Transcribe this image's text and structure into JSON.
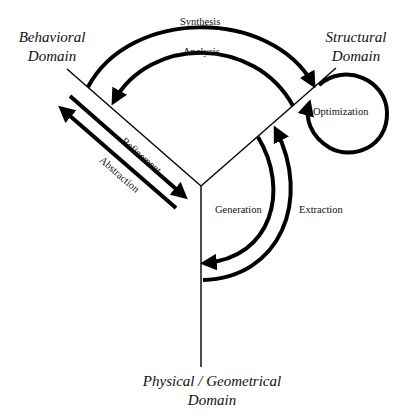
{
  "diagram": {
    "type": "Y-chart",
    "domains": [
      {
        "id": "behavioral",
        "label_line1": "Behavioral",
        "label_line2": "Domain"
      },
      {
        "id": "structural",
        "label_line1": "Structural",
        "label_line2": "Domain"
      },
      {
        "id": "physical",
        "label_line1": "Physical / Geometrical",
        "label_line2": "Domain"
      }
    ],
    "transitions": [
      {
        "id": "synthesis",
        "label": "Synthesis",
        "from": "behavioral",
        "to": "structural"
      },
      {
        "id": "analysis",
        "label": "Analysis",
        "from": "structural",
        "to": "behavioral"
      },
      {
        "id": "optimization",
        "label": "Optimization",
        "from": "structural",
        "to": "structural"
      },
      {
        "id": "generation",
        "label": "Generation",
        "from": "structural",
        "to": "physical"
      },
      {
        "id": "extraction",
        "label": "Extraction",
        "from": "physical",
        "to": "structural"
      },
      {
        "id": "refinement",
        "label": "Refinement",
        "direction": "toward-center"
      },
      {
        "id": "abstraction",
        "label": "Abstraction",
        "direction": "away-from-center"
      }
    ],
    "colors": {
      "stroke": "#000000",
      "background": "#ffffff",
      "text": "#111111"
    }
  }
}
